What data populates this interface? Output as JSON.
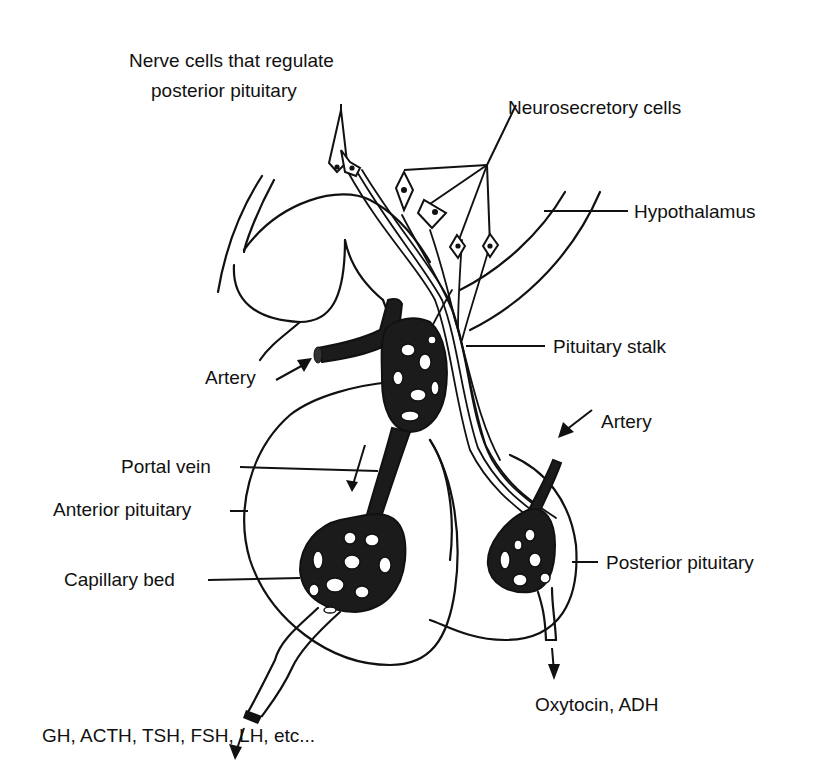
{
  "diagram": {
    "labels": {
      "nerve_cells_line1": "Nerve cells that regulate",
      "nerve_cells_line2": "posterior pituitary",
      "neurosecretory_cells": "Neurosecretory cells",
      "hypothalamus": "Hypothalamus",
      "pituitary_stalk": "Pituitary stalk",
      "artery_left": "Artery",
      "artery_right": "Artery",
      "portal_vein": "Portal vein",
      "anterior_pituitary": "Anterior pituitary",
      "capillary_bed": "Capillary bed",
      "posterior_pituitary": "Posterior pituitary",
      "anterior_hormones": "GH, ACTH, TSH, FSH, LH, etc...",
      "posterior_hormones": "Oxytocin, ADH"
    },
    "colors": {
      "ink": "#111111",
      "background": "#ffffff"
    }
  }
}
